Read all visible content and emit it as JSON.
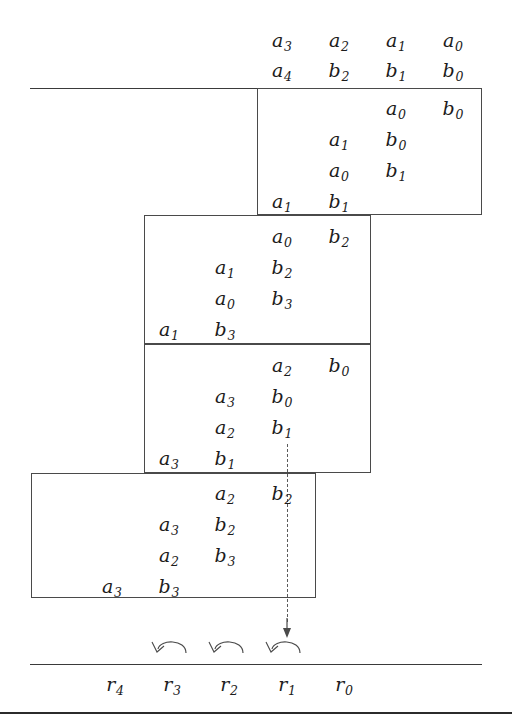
{
  "figure": {
    "type": "multiplication-partial-products-diagram",
    "operand_row_a": [
      {
        "base": "a",
        "sub": "3"
      },
      {
        "base": "a",
        "sub": "2"
      },
      {
        "base": "a",
        "sub": "1"
      },
      {
        "base": "a",
        "sub": "0"
      }
    ],
    "operand_row_b": [
      {
        "base": "a",
        "sub": "4"
      },
      {
        "base": "b",
        "sub": "2"
      },
      {
        "base": "b",
        "sub": "1"
      },
      {
        "base": "b",
        "sub": "0"
      }
    ],
    "partial_product_blocks": [
      {
        "id": "block-1",
        "rows": [
          {
            "left": {
              "base": "a",
              "sub": "0"
            },
            "right": {
              "base": "b",
              "sub": "0"
            }
          },
          {
            "left": {
              "base": "a",
              "sub": "1"
            },
            "right": {
              "base": "b",
              "sub": "0"
            }
          },
          {
            "left": {
              "base": "a",
              "sub": "0"
            },
            "right": {
              "base": "b",
              "sub": "1"
            }
          },
          {
            "left": {
              "base": "a",
              "sub": "1"
            },
            "right": {
              "base": "b",
              "sub": "1"
            }
          }
        ]
      },
      {
        "id": "block-2",
        "rows": [
          {
            "left": {
              "base": "a",
              "sub": "0"
            },
            "right": {
              "base": "b",
              "sub": "2"
            }
          },
          {
            "left": {
              "base": "a",
              "sub": "1"
            },
            "right": {
              "base": "b",
              "sub": "2"
            }
          },
          {
            "left": {
              "base": "a",
              "sub": "0"
            },
            "right": {
              "base": "b",
              "sub": "3"
            }
          },
          {
            "left": {
              "base": "a",
              "sub": "1"
            },
            "right": {
              "base": "b",
              "sub": "3"
            }
          }
        ]
      },
      {
        "id": "block-3",
        "rows": [
          {
            "left": {
              "base": "a",
              "sub": "2"
            },
            "right": {
              "base": "b",
              "sub": "0"
            }
          },
          {
            "left": {
              "base": "a",
              "sub": "3"
            },
            "right": {
              "base": "b",
              "sub": "0"
            }
          },
          {
            "left": {
              "base": "a",
              "sub": "2"
            },
            "right": {
              "base": "b",
              "sub": "1"
            }
          },
          {
            "left": {
              "base": "a",
              "sub": "3"
            },
            "right": {
              "base": "b",
              "sub": "1"
            }
          }
        ]
      },
      {
        "id": "block-4",
        "rows": [
          {
            "left": {
              "base": "a",
              "sub": "2"
            },
            "right": {
              "base": "b",
              "sub": "2"
            }
          },
          {
            "left": {
              "base": "a",
              "sub": "3"
            },
            "right": {
              "base": "b",
              "sub": "2"
            }
          },
          {
            "left": {
              "base": "a",
              "sub": "2"
            },
            "right": {
              "base": "b",
              "sub": "3"
            }
          },
          {
            "left": {
              "base": "a",
              "sub": "3"
            },
            "right": {
              "base": "b",
              "sub": "3"
            }
          }
        ]
      }
    ],
    "result_row": [
      {
        "base": "r",
        "sub": "4"
      },
      {
        "base": "r",
        "sub": "3"
      },
      {
        "base": "r",
        "sub": "2"
      },
      {
        "base": "r",
        "sub": "1"
      },
      {
        "base": "r",
        "sub": "0"
      }
    ],
    "carry_arrows_count": 3,
    "colors": {
      "ink": "#1c1c1c",
      "rule": "#3a3a3a",
      "thick_rule": "#2b2b2b",
      "box_border": "#4a4a4a",
      "dashed": "#5a5a5a",
      "background": "#ffffff"
    }
  }
}
